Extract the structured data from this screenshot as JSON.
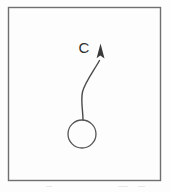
{
  "figure": {
    "kind": "line-drawing",
    "caption_label": "C",
    "frame": {
      "name": "rectangular-border",
      "x": 8.5,
      "y": 7.5,
      "width": 152,
      "height": 173,
      "stroke_color": "#6f6f6f",
      "stroke_width": 1.4,
      "fill_color": "#fdfdfd"
    },
    "circle": {
      "name": "open-circle-body",
      "cx": 82,
      "cy": 134,
      "r": 14,
      "stroke_color": "#555555",
      "stroke_width": 1.3,
      "fill": "none"
    },
    "trajectory": {
      "name": "curved-trajectory-arrow",
      "path": "M 83 120 C 83 110 80.5 101 82.5 92 C 84.5 83 93 72 99.5 60.5",
      "stroke_color": "#4a4a4a",
      "stroke_width": 1.4,
      "arrowhead": {
        "points": "100.5,43.5 104.5,58.5 100.3,55.6 96.6,58.2",
        "fill_color": "#3a3a3a"
      }
    },
    "label": {
      "name": "vector-label-c",
      "text": "C",
      "x": 84,
      "y": 53,
      "font_size": 15,
      "color": "#2e2e2e"
    }
  },
  "colors": {
    "ink": "#3a3a3a",
    "frame": "#6f6f6f",
    "paper": "#fdfdfd",
    "noise": "#e9e9e9"
  }
}
